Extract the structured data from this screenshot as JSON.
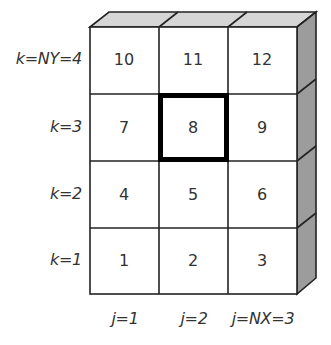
{
  "diagram": {
    "grid": {
      "rows": 4,
      "cols": 3,
      "cells": [
        [
          "10",
          "11",
          "12"
        ],
        [
          "7",
          "8",
          "9"
        ],
        [
          "4",
          "5",
          "6"
        ],
        [
          "1",
          "2",
          "3"
        ]
      ],
      "highlighted_cell": "8"
    },
    "row_labels": [
      "k=NY=4",
      "k=3",
      "k=2",
      "k=1"
    ],
    "col_labels": [
      "j=1",
      "j=2",
      "j=NX=3"
    ],
    "colors": {
      "top_face": "#d6d6d6",
      "side_face": "#9c9c9c",
      "front_face": "#ffffff",
      "line": "#222222",
      "highlight_border": "#000000"
    }
  }
}
